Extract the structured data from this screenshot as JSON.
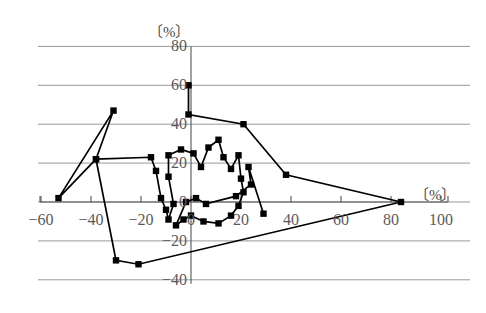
{
  "chart_data": {
    "type": "scatter",
    "title": "",
    "subtitle": "",
    "xlabel": "〔%〕",
    "ylabel": "〔%〕",
    "xlim": [
      -65,
      103
    ],
    "ylim": [
      -45,
      85
    ],
    "grid": true,
    "legend": null,
    "marker": "filled-square",
    "line_style": "solid-connected",
    "color": "#000000",
    "x_ticks": [
      -60,
      -40,
      -20,
      0,
      20,
      40,
      60,
      80,
      100
    ],
    "x_tick_labels": [
      "−60",
      "−40",
      "−20",
      "0",
      "20",
      "40",
      "60",
      "80",
      "100"
    ],
    "y_ticks": [
      -40,
      -20,
      0,
      20,
      40,
      60,
      80
    ],
    "y_tick_labels": [
      "−40",
      "−20",
      "0",
      "20",
      "40",
      "60",
      "80"
    ],
    "series": [
      {
        "name": "series-1",
        "points": [
          [
            -1,
            60
          ],
          [
            -1,
            45
          ],
          [
            21,
            40
          ],
          [
            38,
            14
          ],
          [
            84,
            0
          ],
          [
            -21,
            -32
          ],
          [
            -30,
            -30
          ],
          [
            -38,
            22
          ],
          [
            -31,
            47
          ],
          [
            -53,
            2
          ],
          [
            -38,
            22
          ],
          [
            -16,
            23
          ],
          [
            -14,
            16
          ],
          [
            -12,
            2
          ],
          [
            -10,
            -4
          ],
          [
            -9,
            -9
          ],
          [
            -7,
            -1
          ],
          [
            -9,
            13
          ],
          [
            -9,
            24
          ],
          [
            -4,
            27
          ],
          [
            1,
            25
          ],
          [
            4,
            18
          ],
          [
            7,
            28
          ],
          [
            11,
            32
          ],
          [
            13,
            23
          ],
          [
            16,
            17
          ],
          [
            19,
            24
          ],
          [
            20,
            12
          ],
          [
            21,
            5
          ],
          [
            19,
            -2
          ],
          [
            16,
            -7
          ],
          [
            11,
            -11
          ],
          [
            5,
            -10
          ],
          [
            0,
            -7
          ],
          [
            -3,
            -9
          ],
          [
            -6,
            -12
          ],
          [
            -2,
            0
          ],
          [
            2,
            2
          ],
          [
            6,
            -1
          ],
          [
            18,
            3
          ],
          [
            24,
            9
          ],
          [
            23,
            18
          ],
          [
            29,
            -6
          ]
        ]
      }
    ]
  },
  "axes": {
    "y_unit": "〔%〕",
    "x_unit": "〔%〕"
  }
}
